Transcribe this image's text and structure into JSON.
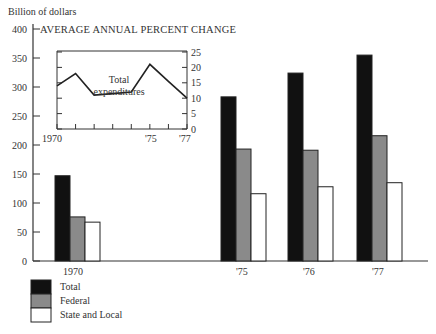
{
  "chart_data": [
    {
      "type": "bar",
      "title": "",
      "ylabel": "Billion of dollars",
      "xlabel": "",
      "ylim": [
        0,
        400
      ],
      "yticks": [
        0,
        50,
        100,
        150,
        200,
        250,
        300,
        350,
        400
      ],
      "categories": [
        "1970",
        "'75",
        "'76",
        "'77"
      ],
      "series": [
        {
          "name": "Total",
          "color": "#111111",
          "values": [
            147,
            283,
            324,
            355
          ]
        },
        {
          "name": "Federal",
          "color": "#8a8a8a",
          "values": [
            76,
            193,
            191,
            216
          ]
        },
        {
          "name": "State and Local",
          "color": "#ffffff",
          "values": [
            67,
            116,
            128,
            135
          ]
        }
      ],
      "legend_position": "bottom-left",
      "grid": false
    },
    {
      "type": "line",
      "title": "AVERAGE ANNUAL PERCENT CHANGE",
      "annotation": "Total expenditures",
      "x": [
        1970,
        1971,
        1972,
        1973,
        1974,
        1975,
        1976,
        1977
      ],
      "xtick_labels": [
        "1970",
        "'75",
        "'77"
      ],
      "series": [
        {
          "name": "Total expenditures",
          "values": [
            14,
            18,
            11,
            11.5,
            12,
            21,
            15.5,
            10
          ]
        }
      ],
      "ylim": [
        0,
        25
      ],
      "yticks": [
        0,
        5,
        10,
        15,
        20,
        25
      ],
      "yaxis_position": "right",
      "grid": false
    }
  ],
  "labels": {
    "y_unit": "Billion of dollars",
    "inset_title": "AVERAGE ANNUAL PERCENT CHANGE",
    "inset_annotation_line1": "Total",
    "inset_annotation_line2": "expenditures",
    "x_1970": "1970",
    "x_75": "'75",
    "x_76": "'76",
    "x_77": "'77",
    "inset_x_1970": "1970",
    "inset_x_75": "'75",
    "inset_x_77": "'77",
    "legend_total": "Total",
    "legend_federal": "Federal",
    "legend_state": "State and Local",
    "yticks": [
      "0",
      "50",
      "100",
      "150",
      "200",
      "250",
      "300",
      "350",
      "400"
    ],
    "inset_yticks": [
      "0",
      "5",
      "10",
      "15",
      "20",
      "25"
    ]
  }
}
